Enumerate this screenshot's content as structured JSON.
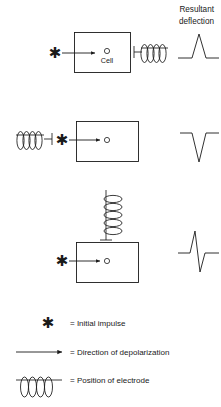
{
  "figure": {
    "header": {
      "line1": "Resultant",
      "line2": "deflection"
    },
    "rows": [
      {
        "id": "row-1",
        "cell_label": "Cell",
        "electrode_position": "right-horizontal",
        "impulse_side": "left",
        "deflection": "upward",
        "waveform_name": "positive-deflection"
      },
      {
        "id": "row-2",
        "cell_label": "",
        "electrode_position": "left-horizontal",
        "impulse_side": "left",
        "deflection": "downward",
        "waveform_name": "negative-deflection"
      },
      {
        "id": "row-3",
        "cell_label": "",
        "electrode_position": "top-vertical",
        "impulse_side": "left",
        "deflection": "biphasic",
        "waveform_name": "biphasic-deflection"
      }
    ],
    "legend": [
      {
        "symbol": "asterisk",
        "text": "=  Initial impulse"
      },
      {
        "symbol": "arrow",
        "text": "=  Direction of depolarization"
      },
      {
        "symbol": "coil",
        "text": "=  Position of electrode"
      }
    ],
    "colors": {
      "ink": "#1a1a1a",
      "background": "#ffffff"
    }
  }
}
